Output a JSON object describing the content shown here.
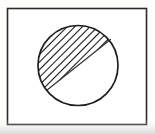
{
  "figure": {
    "description": "A rectangular frame enclosing a circle. The region of the circle on the upper-left side of a diagonal chord is filled with parallel diagonal hatching lines.",
    "background_color": "#fdfdfc",
    "ink_color": "#1d1d1d",
    "hatch_color": "#2a2a2a",
    "canvas": {
      "width": 155,
      "height": 134
    }
  },
  "frame": {
    "label": "outer rectangle border",
    "x": 7.5,
    "y": 8.5,
    "width": 139,
    "height": 116,
    "stroke_width": 1.6,
    "stroke_color": "#2b2b2b",
    "fill_color": "#ffffff"
  },
  "circle": {
    "label": "circle outline",
    "center_x": 78,
    "center_y": 65.5,
    "radius": 40,
    "stroke_width": 1.7,
    "stroke_color": "#1d1d1d",
    "fill_color": "#ffffff"
  },
  "chord": {
    "label": "diagonal chord dividing the circle",
    "start_x": 46.5,
    "start_y": 90.5,
    "end_x": 110.5,
    "end_y": 39.5,
    "stroke_width": 1.2,
    "stroke_color": "#333333",
    "angle_degrees": -38.6
  },
  "hatching": {
    "label": "parallel hatch fill of the upper-left segment",
    "region": "upper-left segment",
    "angle_degrees": -45,
    "spacing_px": 5.4,
    "line_width": 1.15,
    "line_color": "#2a2a2a",
    "line_count": 22
  },
  "shadow": {
    "label": "scan shading along bottom edge",
    "color": "#cfcfcf",
    "opacity": 0.55
  }
}
